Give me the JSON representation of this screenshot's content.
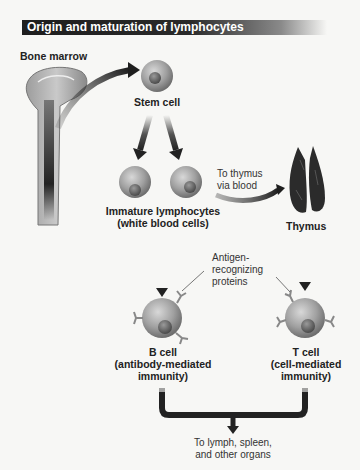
{
  "title": "Origin and maturation of lymphocytes",
  "labels": {
    "bone_marrow": "Bone marrow",
    "stem_cell": "Stem cell",
    "immature_line1": "Immature lymphocytes",
    "immature_line2": "(white blood cells)",
    "to_thymus_line1": "To thymus",
    "to_thymus_line2": "via blood",
    "thymus": "Thymus",
    "antigen_line1": "Antigen-",
    "antigen_line2": "recognizing",
    "antigen_line3": "proteins",
    "b_cell_line1": "B cell",
    "b_cell_line2": "(antibody-mediated",
    "b_cell_line3": "immunity)",
    "t_cell_line1": "T cell",
    "t_cell_line2": "(cell-mediated",
    "t_cell_line3": "immunity)",
    "destination_line1": "To lymph, spleen,",
    "destination_line2": "and other organs"
  },
  "colors": {
    "title_bg": "#1e1e1e",
    "cell_fill": "#9a9a9a",
    "arrow": "#2a2a2a",
    "thymus": "#2b2b2b",
    "background": "#f7f7f5"
  }
}
